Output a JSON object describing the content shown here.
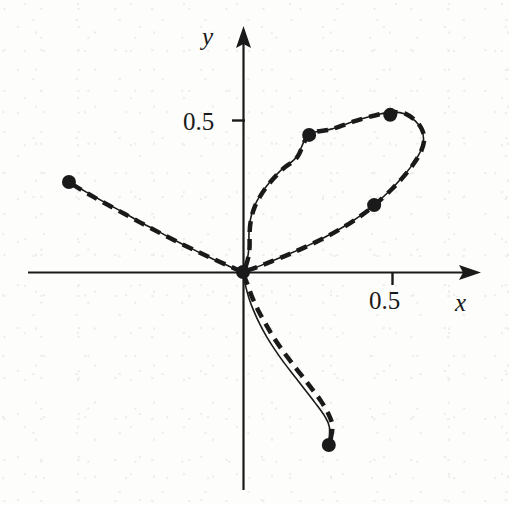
{
  "figure": {
    "title": "",
    "background_color": "#fdfdfb",
    "ink_color": "#1a1a1a"
  },
  "axes": {
    "x_axis_label": "x",
    "y_axis_label": "y",
    "x_tick_label": "0.5",
    "y_tick_label": "0.5",
    "x_tick_value": 0.5,
    "y_tick_value": 0.5,
    "origin_px": [
      243,
      272
    ],
    "px_per_unit_x": 596,
    "px_per_unit_y": 304,
    "x_axis_start_px": 28,
    "x_axis_end_px": 481,
    "y_axis_top_px": 26,
    "y_axis_bottom_px": 490,
    "arrow_heads": [
      "x-axis-arrow",
      "y-axis-arrow"
    ]
  },
  "chart_data": {
    "type": "line",
    "title": "",
    "xlabel": "x",
    "ylabel": "y",
    "xlim": [
      -0.36,
      0.4
    ],
    "ylim": [
      -0.72,
      0.81
    ],
    "grid": false,
    "legend": "none",
    "annotations": [],
    "series": [
      {
        "name": "exact-curve",
        "style": "solid",
        "linewidth": 1.6,
        "color": "#1a1a1a",
        "description": "Solid exact parametric curve: a loop in the first quadrant plus two open branches through the origin",
        "points": [
          [
            -0.292,
            0.296
          ],
          [
            -0.262,
            0.262
          ],
          [
            -0.232,
            0.229
          ],
          [
            -0.201,
            0.196
          ],
          [
            -0.171,
            0.163
          ],
          [
            -0.141,
            0.132
          ],
          [
            -0.111,
            0.101
          ],
          [
            -0.081,
            0.072
          ],
          [
            -0.054,
            0.046
          ],
          [
            -0.03,
            0.025
          ],
          [
            -0.013,
            0.01
          ],
          [
            0.0,
            0.0
          ],
          [
            0.007,
            0.041
          ],
          [
            0.01,
            0.082
          ],
          [
            0.01,
            0.125
          ],
          [
            0.012,
            0.168
          ],
          [
            0.018,
            0.211
          ],
          [
            0.029,
            0.253
          ],
          [
            0.045,
            0.296
          ],
          [
            0.066,
            0.339
          ],
          [
            0.09,
            0.378
          ],
          [
            0.11,
            0.451
          ],
          [
            0.148,
            0.47
          ],
          [
            0.188,
            0.497
          ],
          [
            0.228,
            0.519
          ],
          [
            0.252,
            0.526
          ],
          [
            0.272,
            0.52
          ],
          [
            0.289,
            0.497
          ],
          [
            0.299,
            0.47
          ],
          [
            0.303,
            0.437
          ],
          [
            0.298,
            0.398
          ],
          [
            0.285,
            0.355
          ],
          [
            0.268,
            0.313
          ],
          [
            0.249,
            0.273
          ],
          [
            0.22,
            0.22
          ],
          [
            0.196,
            0.184
          ],
          [
            0.168,
            0.148
          ],
          [
            0.138,
            0.115
          ],
          [
            0.108,
            0.086
          ],
          [
            0.077,
            0.059
          ],
          [
            0.047,
            0.035
          ],
          [
            0.023,
            0.016
          ],
          [
            0.006,
            0.004
          ],
          [
            0.0,
            0.0
          ],
          [
            0.004,
            -0.043
          ],
          [
            0.01,
            -0.086
          ],
          [
            0.018,
            -0.128
          ],
          [
            0.028,
            -0.171
          ],
          [
            0.04,
            -0.214
          ],
          [
            0.054,
            -0.257
          ],
          [
            0.069,
            -0.299
          ],
          [
            0.086,
            -0.342
          ],
          [
            0.103,
            -0.385
          ],
          [
            0.12,
            -0.428
          ],
          [
            0.137,
            -0.474
          ],
          [
            0.145,
            -0.51
          ],
          [
            0.144,
            -0.566
          ]
        ]
      },
      {
        "name": "approximation-curve",
        "style": "dashed",
        "linewidth": 4.5,
        "dash_pattern": "11 7",
        "color": "#1a1a1a",
        "description": "Thick dashed numerical approximation lying almost on top of the exact curve, slightly offset on the two open branches",
        "points": [
          [
            -0.287,
            0.289
          ],
          [
            -0.257,
            0.254
          ],
          [
            -0.227,
            0.221
          ],
          [
            -0.196,
            0.188
          ],
          [
            -0.166,
            0.156
          ],
          [
            -0.136,
            0.125
          ],
          [
            -0.106,
            0.095
          ],
          [
            -0.076,
            0.067
          ],
          [
            -0.05,
            0.043
          ],
          [
            -0.026,
            0.022
          ],
          [
            -0.01,
            0.008
          ],
          [
            0.0,
            0.0
          ],
          [
            0.008,
            0.041
          ],
          [
            0.011,
            0.082
          ],
          [
            0.011,
            0.125
          ],
          [
            0.013,
            0.168
          ],
          [
            0.019,
            0.211
          ],
          [
            0.03,
            0.253
          ],
          [
            0.046,
            0.296
          ],
          [
            0.067,
            0.339
          ],
          [
            0.091,
            0.378
          ],
          [
            0.111,
            0.451
          ],
          [
            0.149,
            0.47
          ],
          [
            0.189,
            0.497
          ],
          [
            0.229,
            0.519
          ],
          [
            0.253,
            0.526
          ],
          [
            0.273,
            0.52
          ],
          [
            0.29,
            0.497
          ],
          [
            0.3,
            0.47
          ],
          [
            0.304,
            0.437
          ],
          [
            0.299,
            0.398
          ],
          [
            0.286,
            0.355
          ],
          [
            0.269,
            0.313
          ],
          [
            0.25,
            0.273
          ],
          [
            0.221,
            0.22
          ],
          [
            0.197,
            0.184
          ],
          [
            0.169,
            0.148
          ],
          [
            0.139,
            0.115
          ],
          [
            0.109,
            0.086
          ],
          [
            0.078,
            0.059
          ],
          [
            0.048,
            0.035
          ],
          [
            0.024,
            0.016
          ],
          [
            0.006,
            0.004
          ],
          [
            0.0,
            0.0
          ],
          [
            0.008,
            -0.043
          ],
          [
            0.016,
            -0.086
          ],
          [
            0.026,
            -0.128
          ],
          [
            0.038,
            -0.171
          ],
          [
            0.051,
            -0.214
          ],
          [
            0.066,
            -0.257
          ],
          [
            0.082,
            -0.299
          ],
          [
            0.099,
            -0.342
          ],
          [
            0.116,
            -0.385
          ],
          [
            0.132,
            -0.428
          ],
          [
            0.145,
            -0.474
          ],
          [
            0.15,
            -0.51
          ],
          [
            0.146,
            -0.56
          ]
        ]
      }
    ],
    "markers": [
      {
        "name": "left-branch-endpoint",
        "x": -0.292,
        "y": 0.296
      },
      {
        "name": "origin-node",
        "x": 0.0,
        "y": 0.0
      },
      {
        "name": "loop-upper-left-node",
        "x": 0.111,
        "y": 0.451
      },
      {
        "name": "loop-top-right-node",
        "x": 0.247,
        "y": 0.517
      },
      {
        "name": "loop-lower-right-node",
        "x": 0.22,
        "y": 0.22
      },
      {
        "name": "lower-branch-endpoint",
        "x": 0.144,
        "y": -0.569
      }
    ],
    "marker_style": {
      "shape": "circle",
      "radius_px": 7,
      "color": "#1a1a1a"
    }
  }
}
